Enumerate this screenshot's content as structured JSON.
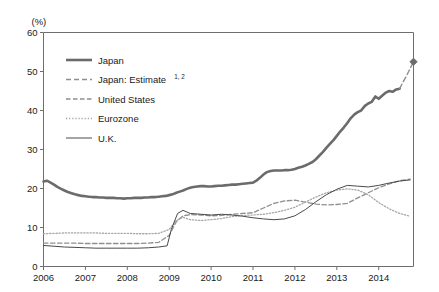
{
  "chart_data": {
    "type": "line",
    "title": "",
    "xlabel": "",
    "ylabel": "(%)",
    "unit_label": "(%)",
    "xlim": [
      2006.0,
      2014.83
    ],
    "ylim": [
      0,
      60
    ],
    "ytick_values": [
      0,
      10,
      20,
      30,
      40,
      50,
      60
    ],
    "ytick_labels": [
      "0",
      "10",
      "20",
      "30",
      "40",
      "50",
      "60"
    ],
    "xtick_values": [
      2006,
      2007,
      2008,
      2009,
      2010,
      2011,
      2012,
      2013,
      2014
    ],
    "xtick_labels": [
      "2006",
      "2007",
      "2008",
      "2009",
      "2010",
      "2011",
      "2012",
      "2013",
      "2014"
    ],
    "grid": false,
    "legend_position": "upper-left-inside",
    "colors": {
      "japan": "#6b6b6b",
      "japan_estimate": "#8f8f8f",
      "united_states": "#8f8f8f",
      "eurozone": "#a8a8a8",
      "uk": "#4a4a4a",
      "axis": "#6e6e6e",
      "text": "#1a1a1a"
    },
    "legend": [
      {
        "key": "japan",
        "label": "Japan",
        "style": "solid-thick",
        "sup": ""
      },
      {
        "key": "japan_estimate",
        "label": "Japan: Estimate",
        "style": "long-dash",
        "sup": "1, 2"
      },
      {
        "key": "united_states",
        "label": "United States",
        "style": "dash",
        "sup": ""
      },
      {
        "key": "eurozone",
        "label": "Eurozone",
        "style": "dot",
        "sup": ""
      },
      {
        "key": "uk",
        "label": "U.K.",
        "style": "solid-thin",
        "sup": ""
      }
    ],
    "marker": {
      "series": "japan_estimate",
      "x": 2014.83,
      "y": 52.5,
      "shape": "diamond"
    },
    "series": [
      {
        "name": "Japan",
        "key": "japan",
        "style": "solid-thick",
        "x": [
          2006.0,
          2006.08,
          2006.17,
          2006.25,
          2006.33,
          2006.42,
          2006.5,
          2006.58,
          2006.67,
          2006.75,
          2006.83,
          2006.92,
          2007.0,
          2007.08,
          2007.17,
          2007.25,
          2007.33,
          2007.42,
          2007.5,
          2007.58,
          2007.67,
          2007.75,
          2007.83,
          2007.92,
          2008.0,
          2008.08,
          2008.17,
          2008.25,
          2008.33,
          2008.42,
          2008.5,
          2008.58,
          2008.67,
          2008.75,
          2008.83,
          2008.92,
          2009.0,
          2009.08,
          2009.17,
          2009.25,
          2009.33,
          2009.42,
          2009.5,
          2009.58,
          2009.67,
          2009.75,
          2009.83,
          2009.92,
          2010.0,
          2010.08,
          2010.17,
          2010.25,
          2010.33,
          2010.42,
          2010.5,
          2010.58,
          2010.67,
          2010.75,
          2010.83,
          2010.92,
          2011.0,
          2011.08,
          2011.17,
          2011.25,
          2011.33,
          2011.42,
          2011.5,
          2011.58,
          2011.67,
          2011.75,
          2011.83,
          2011.92,
          2012.0,
          2012.08,
          2012.17,
          2012.25,
          2012.33,
          2012.42,
          2012.5,
          2012.58,
          2012.67,
          2012.75,
          2012.83,
          2012.92,
          2013.0,
          2013.08,
          2013.17,
          2013.25,
          2013.33,
          2013.42,
          2013.5,
          2013.58,
          2013.67,
          2013.75,
          2013.83,
          2013.92,
          2014.0,
          2014.08,
          2014.17,
          2014.25,
          2014.33,
          2014.42,
          2014.5
        ],
        "y": [
          21.8,
          22.0,
          21.5,
          21.0,
          20.4,
          19.9,
          19.5,
          19.1,
          18.8,
          18.5,
          18.3,
          18.1,
          18.0,
          17.9,
          17.8,
          17.8,
          17.7,
          17.7,
          17.6,
          17.6,
          17.6,
          17.5,
          17.5,
          17.4,
          17.5,
          17.5,
          17.6,
          17.6,
          17.6,
          17.7,
          17.7,
          17.8,
          17.8,
          17.9,
          18.0,
          18.1,
          18.3,
          18.5,
          18.9,
          19.2,
          19.5,
          19.9,
          20.2,
          20.4,
          20.5,
          20.6,
          20.6,
          20.5,
          20.5,
          20.6,
          20.7,
          20.7,
          20.8,
          20.9,
          21.0,
          21.0,
          21.1,
          21.2,
          21.3,
          21.4,
          21.5,
          22.0,
          22.8,
          23.6,
          24.2,
          24.5,
          24.6,
          24.6,
          24.6,
          24.7,
          24.7,
          24.8,
          25.0,
          25.3,
          25.6,
          25.9,
          26.3,
          26.8,
          27.5,
          28.4,
          29.4,
          30.4,
          31.4,
          32.4,
          33.5,
          34.6,
          35.7,
          36.8,
          38.0,
          39.0,
          39.6,
          40.0,
          41.2,
          41.8,
          42.2,
          43.6,
          43.0,
          43.8,
          44.6,
          45.0,
          44.8,
          45.4,
          45.6
        ]
      },
      {
        "name": "Japan: Estimate",
        "key": "japan_estimate",
        "style": "long-dash",
        "x": [
          2014.5,
          2014.58,
          2014.67,
          2014.75,
          2014.83
        ],
        "y": [
          45.6,
          47.3,
          49.0,
          50.8,
          52.5
        ]
      },
      {
        "name": "United States",
        "key": "united_states",
        "style": "dash",
        "x": [
          2006.0,
          2006.25,
          2006.5,
          2006.75,
          2007.0,
          2007.25,
          2007.5,
          2007.75,
          2008.0,
          2008.25,
          2008.5,
          2008.75,
          2009.0,
          2009.17,
          2009.33,
          2009.5,
          2009.75,
          2010.0,
          2010.25,
          2010.5,
          2010.75,
          2011.0,
          2011.25,
          2011.5,
          2011.75,
          2012.0,
          2012.25,
          2012.5,
          2012.75,
          2013.0,
          2013.25,
          2013.5,
          2013.75,
          2014.0,
          2014.25,
          2014.5,
          2014.75
        ],
        "y": [
          6.0,
          6.0,
          6.0,
          6.0,
          5.9,
          5.9,
          5.9,
          5.9,
          5.9,
          5.9,
          6.0,
          6.2,
          8.0,
          11.5,
          13.0,
          13.3,
          13.2,
          13.0,
          13.1,
          13.4,
          13.6,
          13.8,
          15.0,
          16.2,
          16.8,
          17.0,
          16.5,
          16.0,
          15.8,
          15.9,
          16.2,
          17.6,
          18.9,
          20.2,
          21.2,
          22.0,
          22.4
        ]
      },
      {
        "name": "Eurozone",
        "key": "eurozone",
        "style": "dot",
        "x": [
          2006.0,
          2006.25,
          2006.5,
          2006.75,
          2007.0,
          2007.25,
          2007.5,
          2007.75,
          2008.0,
          2008.25,
          2008.5,
          2008.75,
          2009.0,
          2009.17,
          2009.33,
          2009.5,
          2009.75,
          2010.0,
          2010.25,
          2010.5,
          2010.75,
          2011.0,
          2011.25,
          2011.5,
          2011.75,
          2012.0,
          2012.25,
          2012.5,
          2012.75,
          2013.0,
          2013.25,
          2013.5,
          2013.75,
          2014.0,
          2014.25,
          2014.5,
          2014.75
        ],
        "y": [
          8.4,
          8.5,
          8.6,
          8.6,
          8.6,
          8.6,
          8.5,
          8.5,
          8.5,
          8.4,
          8.4,
          8.5,
          9.5,
          11.8,
          12.6,
          12.0,
          11.8,
          12.0,
          12.3,
          12.8,
          13.1,
          13.2,
          13.4,
          13.8,
          14.4,
          15.2,
          16.5,
          17.8,
          18.9,
          19.6,
          19.9,
          19.6,
          18.4,
          16.4,
          14.8,
          13.6,
          12.9
        ]
      },
      {
        "name": "U.K.",
        "key": "uk",
        "style": "solid-thin",
        "x": [
          2006.0,
          2006.25,
          2006.5,
          2006.75,
          2007.0,
          2007.25,
          2007.5,
          2007.75,
          2008.0,
          2008.25,
          2008.5,
          2008.75,
          2008.95,
          2009.05,
          2009.2,
          2009.33,
          2009.5,
          2009.75,
          2010.0,
          2010.25,
          2010.5,
          2010.75,
          2011.0,
          2011.25,
          2011.5,
          2011.75,
          2012.0,
          2012.25,
          2012.5,
          2012.75,
          2013.0,
          2013.25,
          2013.5,
          2013.75,
          2014.0,
          2014.25,
          2014.5,
          2014.75
        ],
        "y": [
          5.4,
          5.2,
          5.0,
          4.9,
          4.8,
          4.7,
          4.7,
          4.7,
          4.7,
          4.7,
          4.8,
          5.0,
          5.3,
          9.5,
          13.6,
          14.4,
          13.6,
          13.4,
          13.2,
          13.4,
          13.2,
          12.9,
          12.5,
          12.2,
          12.0,
          12.2,
          13.0,
          14.6,
          16.6,
          18.4,
          19.8,
          20.8,
          20.6,
          20.4,
          20.8,
          21.4,
          21.9,
          22.2
        ]
      }
    ]
  }
}
